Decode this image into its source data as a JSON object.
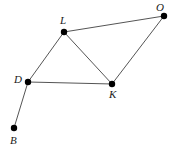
{
  "figure": {
    "kind": "point-and-line-geometry-diagram",
    "background_color": "#ffffff",
    "width": 172,
    "height": 152,
    "edge_color": "#555555",
    "vertex_color": "#000000",
    "label_color": "#1a1a1a"
  },
  "vertices": [
    {
      "id": "O",
      "label": "O",
      "x": 164,
      "y": 16,
      "label_x": 156,
      "label_y": 2,
      "dot_r": 3.2
    },
    {
      "id": "L",
      "label": "L",
      "x": 64,
      "y": 32,
      "label_x": 60,
      "label_y": 15,
      "dot_r": 3.2
    },
    {
      "id": "D",
      "label": "D",
      "x": 28,
      "y": 82,
      "label_x": 14,
      "label_y": 74,
      "dot_r": 3.2
    },
    {
      "id": "K",
      "label": "K",
      "x": 112,
      "y": 84,
      "label_x": 109,
      "label_y": 89,
      "dot_r": 3.2
    },
    {
      "id": "B",
      "label": "B",
      "x": 14,
      "y": 128,
      "label_x": 10,
      "label_y": 135,
      "dot_r": 3.2
    }
  ],
  "edges": [
    {
      "id": "L-O",
      "from": "L",
      "to": "O",
      "x1": 64,
      "y1": 32,
      "x2": 164,
      "y2": 16
    },
    {
      "id": "L-D",
      "from": "L",
      "to": "D",
      "x1": 64,
      "y1": 32,
      "x2": 28,
      "y2": 82
    },
    {
      "id": "L-K",
      "from": "L",
      "to": "K",
      "x1": 64,
      "y1": 32,
      "x2": 112,
      "y2": 84
    },
    {
      "id": "K-O",
      "from": "K",
      "to": "O",
      "x1": 112,
      "y1": 84,
      "x2": 164,
      "y2": 16
    },
    {
      "id": "D-K",
      "from": "D",
      "to": "K",
      "x1": 28,
      "y1": 82,
      "x2": 112,
      "y2": 84
    },
    {
      "id": "D-B",
      "from": "D",
      "to": "B",
      "x1": 28,
      "y1": 82,
      "x2": 14,
      "y2": 128
    }
  ]
}
